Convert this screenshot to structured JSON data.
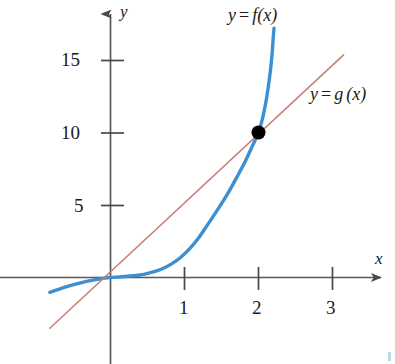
{
  "chart_data": {
    "type": "line",
    "title": "",
    "subtitle": "",
    "xlabel": "x",
    "ylabel": "y",
    "xlim": [
      -0.85,
      3.75
    ],
    "ylim": [
      -1.2,
      17.8
    ],
    "xticks": [
      1,
      2,
      3
    ],
    "xtick_labels": [
      "1",
      "2",
      "3"
    ],
    "yticks": [
      5,
      10,
      15
    ],
    "ytick_labels": [
      "5",
      "10",
      "15"
    ],
    "grid": false,
    "legend_position": "inline-annotations",
    "annotations": [
      {
        "text": "y = f (x)",
        "x": 2.1,
        "y": 17.2
      },
      {
        "text": "y = g (x)",
        "x": 3.15,
        "y": 12.3
      }
    ],
    "series": [
      {
        "name": "y = f (x)",
        "type": "curve",
        "color": "#3c8fd1",
        "width": 3.4,
        "label": "y = f (x)",
        "points": [
          [
            -0.82,
            -1.02
          ],
          [
            -0.7,
            -0.82
          ],
          [
            -0.58,
            -0.62
          ],
          [
            -0.46,
            -0.44
          ],
          [
            -0.34,
            -0.28
          ],
          [
            -0.22,
            -0.16
          ],
          [
            -0.1,
            -0.06
          ],
          [
            0.0,
            0.0
          ],
          [
            0.15,
            0.05
          ],
          [
            0.3,
            0.12
          ],
          [
            0.45,
            0.22
          ],
          [
            0.58,
            0.38
          ],
          [
            0.7,
            0.6
          ],
          [
            0.82,
            0.92
          ],
          [
            0.95,
            1.4
          ],
          [
            1.08,
            2.05
          ],
          [
            1.2,
            2.8
          ],
          [
            1.32,
            3.7
          ],
          [
            1.45,
            4.7
          ],
          [
            1.58,
            5.75
          ],
          [
            1.7,
            6.85
          ],
          [
            1.82,
            8.0
          ],
          [
            1.92,
            9.1
          ],
          [
            2.0,
            10.0
          ],
          [
            2.06,
            11.1
          ],
          [
            2.11,
            12.4
          ],
          [
            2.15,
            13.8
          ],
          [
            2.18,
            15.2
          ],
          [
            2.2,
            16.6
          ],
          [
            2.21,
            17.2
          ]
        ]
      },
      {
        "name": "y = g (x)",
        "type": "line",
        "color": "#c98078",
        "width": 1.6,
        "label": "y = g (x)",
        "points": [
          [
            -0.82,
            -3.5
          ],
          [
            3.15,
            15.35
          ]
        ]
      }
    ],
    "markers": [
      {
        "name": "intersection-point",
        "x": 2,
        "y": 10,
        "color": "#000000",
        "radius": 7
      }
    ]
  },
  "axes": {
    "x_axis_label": "x",
    "y_axis_label": "y",
    "x_tick_labels": [
      "1",
      "2",
      "3"
    ],
    "y_tick_labels": [
      "5",
      "10",
      "15"
    ]
  },
  "labels": {
    "f_label_y": "y",
    "f_label_eq": "=",
    "f_label_fn": "f",
    "f_label_arg": "(x)",
    "g_label_y": "y",
    "g_label_eq": "=",
    "g_label_fn": "g",
    "g_label_arg": "(x)",
    "tick_15": "15",
    "tick_10": "10",
    "tick_5": "5",
    "tick_1": "1",
    "tick_2": "2",
    "tick_3": "3"
  },
  "colors": {
    "curve_f": "#3c8fd1",
    "line_g": "#c98078",
    "axis": "#585858",
    "marker": "#000000",
    "text": "#1a1a1a",
    "corner_mark": "#bcd9ea"
  }
}
